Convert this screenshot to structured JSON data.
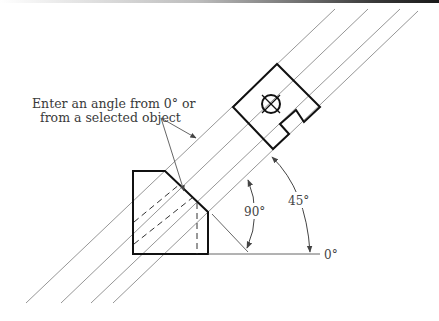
{
  "annotation": {
    "line1": "Enter an angle from 0° or",
    "line2": "from a selected object"
  },
  "angles": {
    "ninety": "90°",
    "forty_five": "45°",
    "zero": "0°"
  },
  "colors": {
    "object_line": "#111111",
    "construction_line": "#8a8a8a",
    "text": "#444444"
  }
}
